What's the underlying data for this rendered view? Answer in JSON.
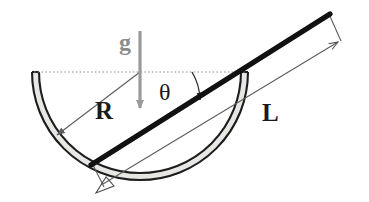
{
  "figure": {
    "type": "physics-free-body-diagram",
    "background_color": "#ffffff"
  },
  "labels": {
    "gravity": "g",
    "radius": "R",
    "length": "L",
    "angle": "θ"
  },
  "colors": {
    "rod": "#111111",
    "bowl_outline": "#1a1a1a",
    "bowl_fill": "#e8e6e3",
    "dimension_line": "#6b6b6b",
    "dashed_line": "#8c8c8c",
    "gravity_arrow": "#9a9a9a",
    "background": "#ffffff"
  },
  "geometry": {
    "bowl": {
      "center_x": 140,
      "center_y": 72,
      "outer_radius": 108,
      "inner_radius": 101,
      "rim_left_x": 33,
      "rim_right_x": 248,
      "rim_y": 72,
      "bottom_y": 183,
      "shape": "hemisphere",
      "wall_thickness": 7
    },
    "rod": {
      "x1": 92,
      "y1": 164,
      "x2": 329,
      "y2": 15,
      "thickness": 5,
      "label": "L"
    },
    "dashed_horizontal": {
      "x1": 34,
      "y1": 72,
      "x2": 246,
      "y2": 72,
      "style": "dotted"
    },
    "gravity_arrow": {
      "x": 140,
      "y1": 33,
      "y2": 110,
      "direction": "down",
      "thickness": 3
    },
    "radius_arrow": {
      "x1": 140,
      "y1": 72,
      "x2": 55,
      "y2": 137,
      "arrow_at": "end"
    },
    "length_dimension": {
      "x1": 105,
      "y1": 185,
      "x2": 341,
      "y2": 43,
      "arrow_at": "both",
      "tick_top": {
        "x1": 329,
        "y1": 15,
        "x2": 341,
        "y2": 43
      },
      "tick_bottom": {
        "x1": 92,
        "y1": 164,
        "x2": 105,
        "y2": 185
      }
    },
    "angle_arc": {
      "center_x": 248,
      "center_y": 72,
      "radius": 56,
      "start_angle_deg": 180,
      "end_angle_deg": 212,
      "value_label": "θ"
    }
  }
}
